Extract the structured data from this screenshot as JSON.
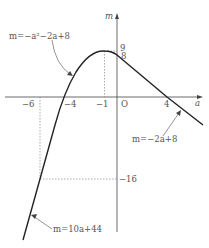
{
  "axes": {
    "x_label": "a",
    "y_label": "m",
    "origin_label": "O"
  },
  "x_ticks": [
    {
      "value": -6,
      "label": "−6"
    },
    {
      "value": -4,
      "label": "−4"
    },
    {
      "value": -1,
      "label": "−1"
    },
    {
      "value": 4,
      "label": "4"
    }
  ],
  "y_ticks": [
    {
      "value": 9,
      "label": "9"
    },
    {
      "value": 8,
      "label": "8"
    },
    {
      "value": -16,
      "label": "−16"
    }
  ],
  "annotations": {
    "parabola": "m=−a²−2a+8",
    "line_right": "m=−2a+8",
    "line_left": "m=10a+44"
  },
  "colors": {
    "curve": "#222222",
    "axis": "#444444",
    "dotted": "#888888",
    "text": "#555555"
  }
}
